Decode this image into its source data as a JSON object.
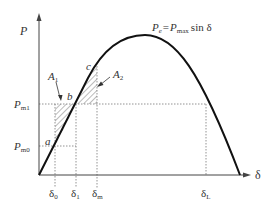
{
  "diagram": {
    "y_axis_label": "P",
    "x_axis_label": "δ",
    "equation": {
      "lhs": "P",
      "lhs_sub": "e",
      "eq": "=",
      "rhs": "P",
      "rhs_sub": "max",
      "func": "sin δ"
    },
    "y_ticks": [
      {
        "main": "P",
        "sub": "m1"
      },
      {
        "main": "P",
        "sub": "m0"
      }
    ],
    "x_ticks": [
      {
        "main": "δ",
        "sub": "0"
      },
      {
        "main": "δ",
        "sub": "1"
      },
      {
        "main": "δ",
        "sub": "m"
      },
      {
        "main": "δ",
        "sub": "L"
      }
    ],
    "points": {
      "a": "a",
      "b": "b",
      "c": "c"
    },
    "areas": [
      {
        "main": "A",
        "sub": "1"
      },
      {
        "main": "A",
        "sub": "2"
      }
    ],
    "colors": {
      "curve": "#111111",
      "axis": "#444444",
      "dotted": "#666666",
      "hatch": "#555555"
    }
  }
}
